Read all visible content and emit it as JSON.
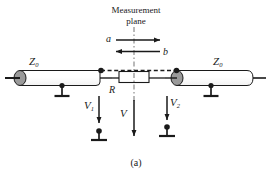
{
  "figure": {
    "caption": "(a)",
    "title_line1": "Measurement",
    "title_line2": "plane",
    "colors": {
      "stroke": "#1a1a1a",
      "cable_fill": "#ffffff",
      "connector_fill": "#9a9a9a",
      "dashed": "#1a1a1a",
      "background": "#ffffff"
    }
  },
  "labels": {
    "z0_left": "Z",
    "z0_left_sub": "0",
    "z0_right": "Z",
    "z0_right_sub": "0",
    "resistor": "R",
    "wave_incident": "a",
    "wave_reflected": "b",
    "v1": "V",
    "v1_sub": "1",
    "v_center": "V",
    "v2": "V",
    "v2_sub": "2"
  },
  "elements": {
    "left_transmission_line": "coaxial-cable-left",
    "right_transmission_line": "coaxial-cable-right",
    "resistor_box": "resistor-R",
    "measurement_plane_line": "dash-dot-vertical",
    "ground_symbols": 4,
    "arrows": {
      "a_direction": "right",
      "b_direction": "left",
      "v1_direction": "down",
      "v_direction": "down",
      "v2_direction": "down"
    }
  }
}
